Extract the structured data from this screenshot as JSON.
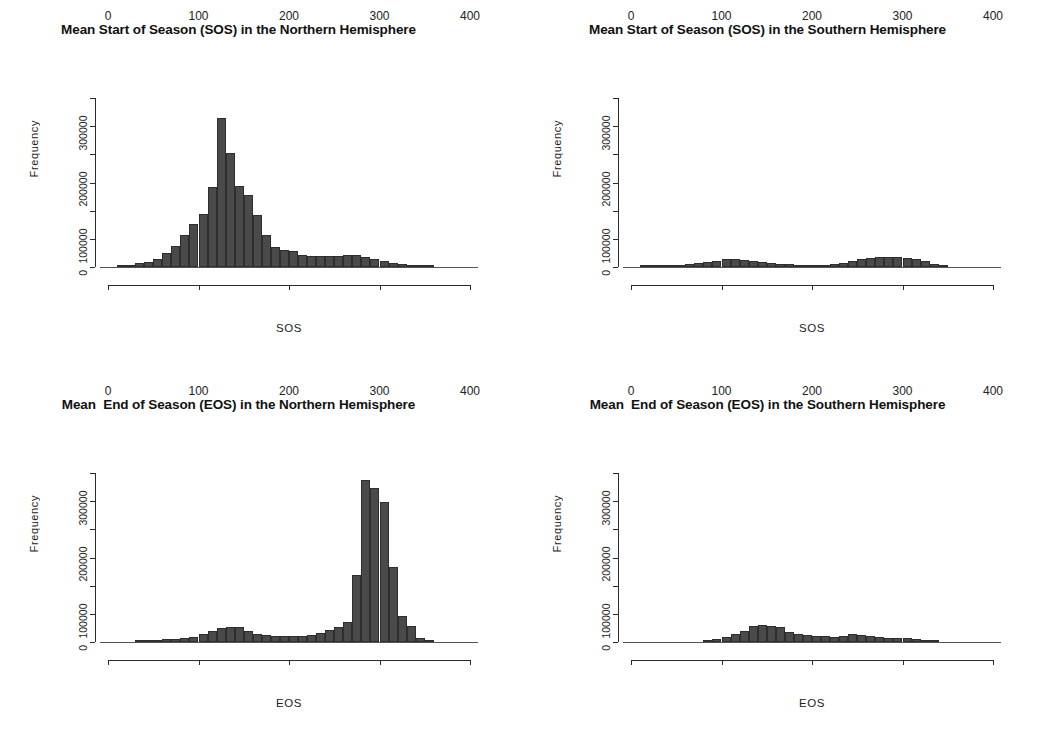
{
  "figure": {
    "background": "#ffffff",
    "bar_fill": "#4a4a4a",
    "bar_border": "#2e2e2e",
    "axis_color": "#2b2b2b"
  },
  "panels": [
    {
      "id": "sos-northern",
      "title": "Mean Start of Season (SOS) in the Northern Hemisphere",
      "xlabel": "SOS",
      "ylabel": "Frequency"
    },
    {
      "id": "sos-southern",
      "title": "Mean Start of Season (SOS) in the Southern Hemisphere",
      "xlabel": "SOS",
      "ylabel": "Frequency"
    },
    {
      "id": "eos-northern",
      "title": "Mean  End of Season (EOS) in the Northern Hemisphere",
      "xlabel": "EOS",
      "ylabel": "Frequency"
    },
    {
      "id": "eos-southern",
      "title": "Mean  End of Season (EOS) in the Southern Hemisphere",
      "xlabel": "EOS",
      "ylabel": "Frequency"
    }
  ],
  "axes": {
    "x_ticks": [
      0,
      100,
      200,
      300,
      400
    ],
    "x_tick_labels": [
      "0",
      "100",
      "200",
      "300",
      "400"
    ],
    "xlim": [
      0,
      400
    ],
    "y_ticks_labeled": [
      0,
      100000,
      200000,
      300000
    ],
    "y_tick_labels": [
      "0",
      "100000",
      "200000",
      "300000"
    ],
    "y_ticks_minor": [
      50000,
      150000,
      250000
    ],
    "ylim": [
      0,
      300000
    ],
    "grid": false,
    "legend": null
  },
  "chart_data": [
    {
      "type": "bar",
      "id": "sos-northern",
      "title": "Mean Start of Season (SOS) in the Northern Hemisphere",
      "xlabel": "SOS",
      "ylabel": "Frequency",
      "xlim": [
        0,
        400
      ],
      "ylim": [
        0,
        300000
      ],
      "bin_width": 10,
      "bin_starts": [
        10,
        20,
        30,
        40,
        50,
        60,
        70,
        80,
        90,
        100,
        110,
        120,
        130,
        140,
        150,
        160,
        170,
        180,
        190,
        200,
        210,
        220,
        230,
        240,
        250,
        260,
        270,
        280,
        290,
        300,
        310,
        320,
        330,
        340,
        350
      ],
      "values": [
        1500,
        4000,
        7000,
        9000,
        14000,
        24000,
        38000,
        56000,
        76000,
        94000,
        142000,
        265000,
        203000,
        143000,
        127000,
        93000,
        57000,
        35000,
        30000,
        28000,
        21000,
        19000,
        19000,
        20000,
        20000,
        21000,
        21000,
        18000,
        14000,
        10000,
        7000,
        5000,
        3000,
        1500,
        800
      ],
      "grid": false,
      "legend": null
    },
    {
      "type": "bar",
      "id": "sos-southern",
      "title": "Mean Start of Season (SOS) in the Southern Hemisphere",
      "xlabel": "SOS",
      "ylabel": "Frequency",
      "xlim": [
        0,
        400
      ],
      "ylim": [
        0,
        300000
      ],
      "bin_width": 10,
      "bin_starts": [
        10,
        20,
        30,
        40,
        50,
        60,
        70,
        80,
        90,
        100,
        110,
        120,
        130,
        140,
        150,
        160,
        170,
        180,
        190,
        200,
        210,
        220,
        230,
        240,
        250,
        260,
        270,
        280,
        290,
        300,
        310,
        320,
        330,
        340
      ],
      "values": [
        1200,
        2200,
        2800,
        3200,
        3800,
        4500,
        7000,
        9000,
        11000,
        13500,
        14000,
        13000,
        11000,
        9500,
        8000,
        6000,
        4500,
        3500,
        3000,
        3000,
        3500,
        5000,
        7500,
        11000,
        14000,
        16000,
        17500,
        18000,
        17000,
        16000,
        14500,
        11000,
        6000,
        2500
      ],
      "grid": false,
      "legend": null
    },
    {
      "type": "bar",
      "id": "eos-northern",
      "title": "Mean  End of Season (EOS) in the Northern Hemisphere",
      "xlabel": "EOS",
      "ylabel": "Frequency",
      "xlim": [
        0,
        400
      ],
      "ylim": [
        0,
        300000
      ],
      "bin_width": 10,
      "bin_starts": [
        30,
        40,
        50,
        60,
        70,
        80,
        90,
        100,
        110,
        120,
        130,
        140,
        150,
        160,
        170,
        180,
        190,
        200,
        210,
        220,
        230,
        240,
        250,
        260,
        270,
        280,
        290,
        300,
        310,
        320,
        330,
        340,
        350
      ],
      "values": [
        2000,
        2500,
        3500,
        4500,
        5000,
        7000,
        9000,
        14000,
        20000,
        25000,
        27000,
        26000,
        20000,
        14000,
        12000,
        11000,
        11000,
        11000,
        10000,
        12000,
        16000,
        22000,
        27000,
        36000,
        119000,
        288000,
        274000,
        248000,
        134000,
        46000,
        28000,
        8000,
        2000
      ],
      "grid": false,
      "legend": null
    },
    {
      "type": "bar",
      "id": "eos-southern",
      "title": "Mean  End of Season (EOS) in the Southern Hemisphere",
      "xlabel": "EOS",
      "ylabel": "Frequency",
      "xlim": [
        0,
        400
      ],
      "ylim": [
        0,
        300000
      ],
      "bin_width": 10,
      "bin_starts": [
        80,
        90,
        100,
        110,
        120,
        130,
        140,
        150,
        160,
        170,
        180,
        190,
        200,
        210,
        220,
        230,
        240,
        250,
        260,
        270,
        280,
        290,
        300,
        310,
        320,
        330
      ],
      "values": [
        3000,
        6000,
        9000,
        14000,
        20000,
        29000,
        30000,
        29000,
        26000,
        18000,
        14000,
        12000,
        11000,
        10000,
        9000,
        11000,
        14000,
        13000,
        11000,
        9000,
        8000,
        8000,
        7000,
        5000,
        2500,
        1000
      ],
      "grid": false,
      "legend": null
    }
  ]
}
